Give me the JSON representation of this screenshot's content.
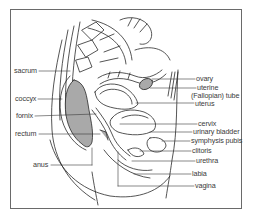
{
  "diagram": {
    "colors": {
      "line": "#2a2a2a",
      "fill_organ": "#a9a9a9",
      "frame": "#6a6a6a",
      "label": "#3a3a3a"
    },
    "labels_left": [
      {
        "id": "sacrum",
        "text": "sacrum",
        "x": 14,
        "y": 67
      },
      {
        "id": "coccyx",
        "text": "coccyx",
        "x": 15,
        "y": 95
      },
      {
        "id": "fornix",
        "text": "fornix",
        "x": 16,
        "y": 112
      },
      {
        "id": "rectum",
        "text": "rectum",
        "x": 15,
        "y": 130
      },
      {
        "id": "anus",
        "text": "anus",
        "x": 33,
        "y": 161
      }
    ],
    "labels_right": [
      {
        "id": "ovary",
        "text": "ovary",
        "x": 196,
        "y": 75
      },
      {
        "id": "uterine",
        "text": "uterine",
        "x": 197,
        "y": 84
      },
      {
        "id": "fallopian-tube",
        "text": "(Fallopian) tube",
        "x": 191,
        "y": 92
      },
      {
        "id": "uterus",
        "text": "uterus",
        "x": 195,
        "y": 100
      },
      {
        "id": "cervix",
        "text": "cervix",
        "x": 198,
        "y": 120
      },
      {
        "id": "urinary-bladder",
        "text": "urinary bladder",
        "x": 193,
        "y": 128
      },
      {
        "id": "symphysis-pubis",
        "text": "symphysis pubis",
        "x": 191,
        "y": 137
      },
      {
        "id": "clitoris",
        "text": "clitoris",
        "x": 192,
        "y": 147
      },
      {
        "id": "urethra",
        "text": "urethra",
        "x": 196,
        "y": 157
      },
      {
        "id": "labia",
        "text": "labia",
        "x": 192,
        "y": 170
      },
      {
        "id": "vagina",
        "text": "vagina",
        "x": 195,
        "y": 182
      }
    ]
  }
}
